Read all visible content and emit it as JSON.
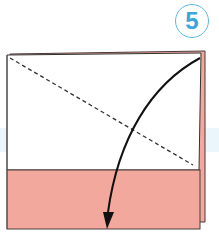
{
  "diagram": {
    "step_number": "5",
    "colors": {
      "paper_front": "#ffffff",
      "paper_back": "#f2a89c",
      "outline": "#4a3a3a",
      "step_circle": "#5bbbe6",
      "background_band": "#eaf6fc"
    },
    "elements": [
      {
        "type": "paper-square-back-layer",
        "color": "pink"
      },
      {
        "type": "paper-square-front",
        "color": "white"
      },
      {
        "type": "folded-strip-bottom",
        "color": "pink"
      },
      {
        "type": "valley-fold-line",
        "style": "dashed",
        "from": "top-left",
        "to": "lower-right"
      },
      {
        "type": "fold-arrow",
        "from": "top-right-corner",
        "to": "bottom-edge"
      }
    ]
  }
}
